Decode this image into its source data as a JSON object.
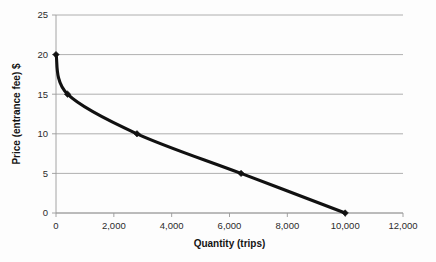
{
  "chart_data": {
    "type": "line",
    "title": "",
    "xlabel": "Quantity (trips)",
    "ylabel": "Price (entrance fee) $",
    "xlim": [
      0,
      12000
    ],
    "ylim": [
      0,
      25
    ],
    "grid": true,
    "legend": "none",
    "x_ticks": [
      0,
      2000,
      4000,
      6000,
      8000,
      10000,
      12000
    ],
    "x_tick_labels": [
      "0",
      "2,000",
      "4,000",
      "6,000",
      "8,000",
      "10,000",
      "12,000"
    ],
    "y_ticks": [
      0,
      5,
      10,
      15,
      20,
      25
    ],
    "y_tick_labels": [
      "0",
      "5",
      "10",
      "15",
      "20",
      "25"
    ],
    "series": [
      {
        "name": "Demand curve",
        "color": "#111111",
        "marker": "diamond",
        "x": [
          0,
          400,
          2800,
          6400,
          10000
        ],
        "y": [
          20,
          15,
          10,
          5,
          0
        ]
      }
    ]
  },
  "axis_titles": {
    "x": "Quantity (trips)",
    "y": "Price (entrance fee) $"
  }
}
